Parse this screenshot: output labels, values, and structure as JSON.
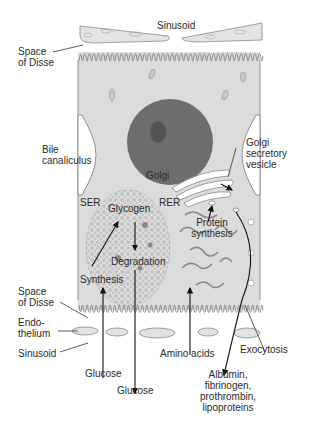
{
  "figure": {
    "colors": {
      "cytoplasm": "#dcdcdc",
      "outline": "#7a7a7a",
      "nucleus": "#6a6a6a",
      "nucleolus": "#4e4e4e",
      "endothelium": "#e2e2e2",
      "arrow": "#111111",
      "text": "#2a2a2a"
    }
  },
  "labels": {
    "sinusoid_top": "Sinusoid",
    "space_of_disse_top": [
      "Space",
      "of Disse"
    ],
    "bile_canaliculus": [
      "Bile",
      "canaliculus"
    ],
    "golgi": "Golgi",
    "golgi_secretory_vesicle": [
      "Golgi",
      "secretory",
      "vesicle"
    ],
    "ser": "SER",
    "glycogen": "Glycogen",
    "rer": "RER",
    "protein_synthesis": [
      "Protein",
      "synthesis"
    ],
    "degradation": "Degradation",
    "synthesis": "Synthesis",
    "space_of_disse_bottom": [
      "Space",
      "of Disse"
    ],
    "endothelium": [
      "Endo-",
      "thelium"
    ],
    "sinusoid_bottom": "Sinusoid",
    "amino_acids": "Amino acids",
    "exocytosis": "Exocytosis",
    "glucose_in": "Glucose",
    "glucose_out": "Glucose",
    "secreted_proteins": [
      "Albumin,",
      "fibrinogen,",
      "prothrombin,",
      "lipoproteins"
    ]
  }
}
